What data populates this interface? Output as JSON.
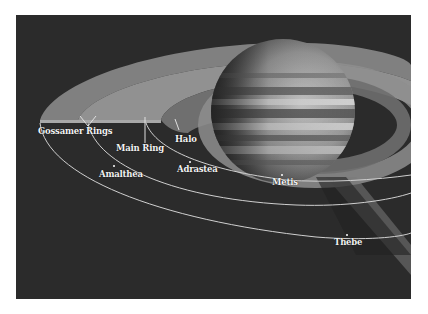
{
  "diagram": {
    "colors": {
      "background": "#2b2b2b",
      "ring_fill": "#8e8e8e",
      "orbit_line": "#d8d8d8",
      "label": "#f2f2f2"
    },
    "labels": {
      "gossamer_rings": "Gossamer Rings",
      "main_ring": "Main Ring",
      "halo": "Halo",
      "amalthea": "Amalthea",
      "adrastea": "Adrastea",
      "metis": "Metis",
      "thebe": "Thebe"
    }
  }
}
